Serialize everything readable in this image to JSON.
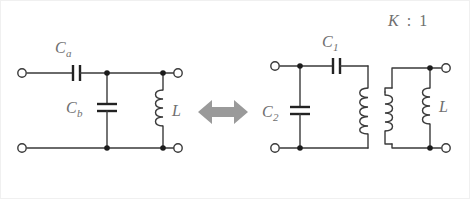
{
  "figure": {
    "background_color": "#ffffff",
    "wire_color": "#3a3a3a",
    "label_color": "#6f6f6f",
    "arrow_color": "#9a9a9a",
    "width": 470,
    "height": 199
  },
  "relation": {
    "symbol": "double-headed-arrow",
    "meaning": "equivalent-to"
  },
  "transformer": {
    "ratio_label": "K : 1",
    "ratio_k": "K",
    "ratio_separator": ":",
    "ratio_one": "1",
    "primary_turns": 5,
    "secondary_turns": 4
  },
  "left_circuit": {
    "name": "pi-network-with-series-capacitor",
    "components": [
      {
        "id": "Ca",
        "type": "capacitor",
        "label": "C",
        "subscript": "a",
        "orientation": "series-horizontal",
        "plates": "vertical"
      },
      {
        "id": "Cb",
        "type": "capacitor",
        "label": "C",
        "subscript": "b",
        "orientation": "shunt-vertical",
        "plates": "horizontal"
      },
      {
        "id": "L",
        "type": "inductor",
        "label": "L",
        "subscript": "",
        "orientation": "shunt-vertical",
        "turns": 4
      }
    ],
    "terminals": [
      {
        "name": "input-top",
        "position": "top-left"
      },
      {
        "name": "input-bottom",
        "position": "bottom-left"
      },
      {
        "name": "output-top",
        "position": "top-right"
      },
      {
        "name": "output-bottom",
        "position": "bottom-right"
      }
    ]
  },
  "right_circuit": {
    "name": "transformer-coupled-network",
    "components": [
      {
        "id": "C1",
        "type": "capacitor",
        "label": "C",
        "subscript": "1",
        "orientation": "series-horizontal",
        "plates": "vertical"
      },
      {
        "id": "C2",
        "type": "capacitor",
        "label": "C",
        "subscript": "2",
        "orientation": "shunt-vertical",
        "plates": "horizontal"
      },
      {
        "id": "T1",
        "type": "transformer",
        "label": "K : 1",
        "primary_turns": 5,
        "secondary_turns": 4
      },
      {
        "id": "L",
        "type": "inductor",
        "label": "L",
        "subscript": "",
        "orientation": "shunt-vertical",
        "turns": 4
      }
    ],
    "terminals": [
      {
        "name": "input-top",
        "position": "top-left"
      },
      {
        "name": "input-bottom",
        "position": "bottom-left"
      },
      {
        "name": "output-top",
        "position": "top-right"
      },
      {
        "name": "output-bottom",
        "position": "bottom-right"
      }
    ]
  }
}
